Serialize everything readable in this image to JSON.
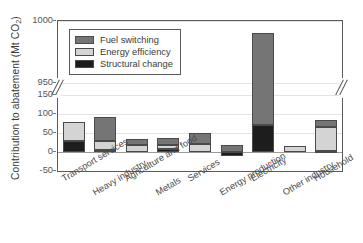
{
  "chart_data": {
    "type": "bar",
    "subtype": "stacked-bar-broken-axis",
    "title": "",
    "xlabel": "",
    "ylabel": "Contribution to abatement (Mt CO2)",
    "ylabel_main": "Contribution to abatement (Mt CO",
    "ylabel_sub": "2",
    "ylabel_close": ")",
    "grid": true,
    "legend_position": "upper-left-inside",
    "axis_break": true,
    "axis_break_note": "y-axis broken between 150 and 950",
    "ylim_lower": [
      -50,
      150
    ],
    "ylim_upper": [
      950,
      1000
    ],
    "ytick_labels": [
      "1000",
      "950",
      "150",
      "100",
      "50",
      "0",
      "-50"
    ],
    "ytick_values": [
      1000,
      950,
      150,
      100,
      50,
      0,
      -50
    ],
    "categories": [
      "Transport services",
      "Heavy industry",
      "Agriculture and food",
      "Metals",
      "Services",
      "Energy production",
      "Electricity",
      "Other industry",
      "Household"
    ],
    "series": [
      {
        "name": "Structural change",
        "color": "#1d1d1d",
        "values": [
          30,
          5,
          0,
          7,
          0,
          -10,
          72,
          0,
          3
        ]
      },
      {
        "name": "Energy efficiency",
        "color": "#d4d4d4",
        "values": [
          50,
          23,
          18,
          11,
          22,
          0,
          0,
          15,
          62
        ]
      },
      {
        "name": "Fuel switching",
        "color": "#757575",
        "values": [
          0,
          65,
          17,
          20,
          27,
          18,
          918,
          0,
          18
        ]
      }
    ],
    "totals": [
      80,
      93,
      35,
      38,
      49,
      18,
      990,
      15,
      83
    ],
    "legend": [
      {
        "label": "Fuel switching",
        "color": "#757575"
      },
      {
        "label": "Energy efficiency",
        "color": "#d4d4d4"
      },
      {
        "label": "Structural change",
        "color": "#1d1d1d"
      }
    ]
  }
}
